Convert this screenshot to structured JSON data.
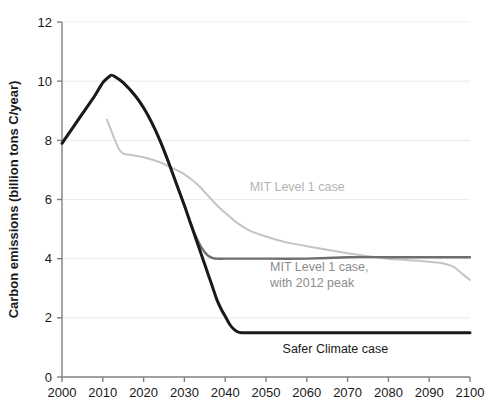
{
  "chart_data": {
    "type": "line",
    "title": "",
    "subtitle": "",
    "xlabel": "",
    "ylabel": "Carbon emissions (billion tons C/year)",
    "xlim": [
      2000,
      2100
    ],
    "ylim": [
      0,
      12
    ],
    "grid": true,
    "grid_axis": "y",
    "legend_position": "inline-annotations",
    "x_ticks": [
      2000,
      2010,
      2020,
      2030,
      2040,
      2050,
      2060,
      2070,
      2080,
      2090,
      2100
    ],
    "x_tick_labels": [
      "2000",
      "2010",
      "2020",
      "2030",
      "2040",
      "2050",
      "2060",
      "2070",
      "2080",
      "2090",
      "2100"
    ],
    "y_ticks": [
      0,
      2,
      4,
      6,
      8,
      10,
      12
    ],
    "y_tick_labels": [
      "0",
      "2",
      "4",
      "6",
      "8",
      "10",
      "12"
    ],
    "series": [
      {
        "name": "MIT Level 1 case",
        "color": "#c4c4c4",
        "width": 2.0,
        "x": [
          2011,
          2012,
          2013,
          2014,
          2015,
          2016,
          2018,
          2020,
          2022,
          2025,
          2028,
          2030,
          2032,
          2034,
          2036,
          2038,
          2040,
          2043,
          2046,
          2050,
          2055,
          2060,
          2065,
          2070,
          2075,
          2080,
          2085,
          2090,
          2093,
          2096,
          2098,
          2100
        ],
        "y": [
          8.7,
          8.35,
          8.0,
          7.7,
          7.55,
          7.52,
          7.48,
          7.43,
          7.35,
          7.2,
          7.0,
          6.85,
          6.65,
          6.4,
          6.1,
          5.8,
          5.55,
          5.2,
          4.95,
          4.75,
          4.55,
          4.42,
          4.3,
          4.18,
          4.08,
          4.0,
          3.95,
          3.9,
          3.85,
          3.72,
          3.5,
          3.28
        ]
      },
      {
        "name": "MIT Level 1 case, with 2012 peak",
        "color": "#6e6e6e",
        "width": 2.4,
        "x": [
          2000,
          2005,
          2008,
          2010,
          2012,
          2013,
          2015,
          2018,
          2020,
          2022,
          2024,
          2026,
          2028,
          2030,
          2031,
          2032,
          2033,
          2034,
          2035,
          2036,
          2037,
          2038,
          2040,
          2050,
          2060,
          2070,
          2080,
          2090,
          2100
        ],
        "y": [
          7.9,
          8.9,
          9.5,
          9.95,
          10.2,
          10.15,
          9.95,
          9.5,
          9.1,
          8.6,
          8.0,
          7.3,
          6.55,
          5.8,
          5.4,
          5.0,
          4.7,
          4.42,
          4.22,
          4.08,
          4.02,
          4.0,
          4.0,
          4.0,
          4.0,
          4.05,
          4.05,
          4.05,
          4.05
        ]
      },
      {
        "name": "Safer Climate case",
        "color": "#1a1a1a",
        "width": 3.0,
        "x": [
          2000,
          2005,
          2008,
          2010,
          2012,
          2013,
          2015,
          2018,
          2020,
          2022,
          2024,
          2026,
          2028,
          2030,
          2031,
          2032,
          2033,
          2034,
          2035,
          2036,
          2037,
          2038,
          2039,
          2040,
          2041,
          2042,
          2043,
          2044,
          2050,
          2060,
          2070,
          2080,
          2090,
          2100
        ],
        "y": [
          7.9,
          8.9,
          9.5,
          9.95,
          10.2,
          10.15,
          9.95,
          9.5,
          9.1,
          8.6,
          8.0,
          7.3,
          6.55,
          5.8,
          5.4,
          5.0,
          4.6,
          4.2,
          3.8,
          3.4,
          3.0,
          2.6,
          2.3,
          2.05,
          1.8,
          1.63,
          1.53,
          1.5,
          1.5,
          1.5,
          1.5,
          1.5,
          1.5,
          1.5
        ]
      }
    ],
    "annotations": [
      {
        "id": "annot-mit-level1",
        "text": "MIT Level 1 case",
        "x": 2046,
        "y": 6.3,
        "color": "#b3b3b3"
      },
      {
        "id": "annot-mit-2012-peak-line1",
        "text": "MIT Level 1 case,",
        "x": 2051,
        "y": 3.58,
        "color": "#8c8c8c"
      },
      {
        "id": "annot-mit-2012-peak-line2",
        "text": "with 2012 peak",
        "x": 2051,
        "y": 3.05,
        "color": "#8c8c8c"
      },
      {
        "id": "annot-safer-climate",
        "text": "Safer Climate case",
        "x": 2067,
        "y": 0.82,
        "color": "#1a1a1a"
      }
    ],
    "colors": {
      "axis": "#808080",
      "grid": "#ededed",
      "text": "#1a1a1a",
      "series_light": "#c4c4c4",
      "series_mid": "#6e6e6e",
      "series_dark": "#1a1a1a",
      "background": "#ffffff"
    }
  }
}
